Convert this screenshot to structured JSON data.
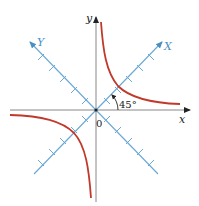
{
  "figure": {
    "labels": {
      "x_axis": "x",
      "y_axis": "y",
      "X_axis": "X",
      "Y_axis": "Y",
      "origin": "0",
      "angle": "45°"
    },
    "colors": {
      "axis": "#333333",
      "rotated_axis": "#5a9fd0",
      "curve": "#c0392b",
      "background": "#ffffff"
    },
    "geometry": {
      "origin": [
        96,
        110
      ],
      "rotated_tick_count_each_side": 5
    }
  }
}
